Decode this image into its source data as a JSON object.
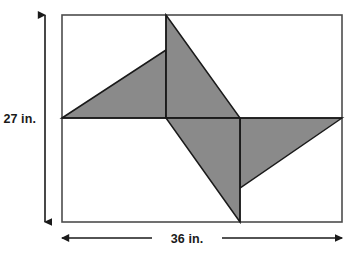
{
  "figure": {
    "shape_type": "rectangle-with-inscribed-pinwheel",
    "background_color": "#ffffff",
    "outline_color": "#4d4d4d",
    "shaded_fill_color": "#8a8a8a",
    "shaded_stroke_color": "#1a1a1a",
    "arrow_color": "#1a1a1a",
    "rectangle": {
      "x": 62,
      "y": 15,
      "width": 280,
      "height": 207
    },
    "interior_lines": {
      "horizontal_y": 118,
      "vertical_left_x": 166,
      "vertical_right_x": 240
    },
    "pinwheel_points": {
      "top_apex": "166,15",
      "left_blade_tip": "62,118",
      "left_blade_vertex": "166,50",
      "bottom_apex": "240,222",
      "right_blade_tip": "342,118",
      "right_blade_vertex": "240,188",
      "center_upper_left": "166,118",
      "center_upper_right": "240,118"
    },
    "blades": [
      {
        "name": "upper-left-blade",
        "points": "62,118 166,50 166,118"
      },
      {
        "name": "upper-right-blade",
        "points": "166,15 240,118 166,118"
      },
      {
        "name": "lower-right-blade",
        "points": "342,118 240,188 240,118"
      },
      {
        "name": "lower-left-blade",
        "points": "240,222 166,118 240,118"
      }
    ]
  },
  "dimensions": {
    "height_label": "27 in.",
    "height_value": 27,
    "height_unit": "in.",
    "width_label": "36 in.",
    "width_value": 36,
    "width_unit": "in.",
    "vertical_arrow": {
      "x": 45,
      "y_top": 15,
      "y_bottom": 222
    },
    "horizontal_arrow": {
      "y": 238,
      "x_left": 62,
      "x_right": 342
    }
  }
}
